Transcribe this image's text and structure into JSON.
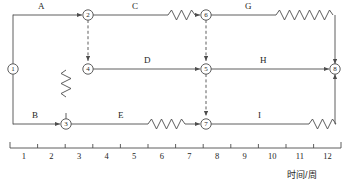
{
  "diagram": {
    "kind": "time-scaled-network-diagram",
    "stroke_color": "#4d4d4d",
    "text_color": "#262626",
    "nodes": [
      {
        "id": "n1",
        "label": "1",
        "x": 13,
        "y": 69
      },
      {
        "id": "n2",
        "label": "2",
        "x": 88,
        "y": 15
      },
      {
        "id": "n4",
        "label": "4",
        "x": 88,
        "y": 69
      },
      {
        "id": "n3",
        "label": "3",
        "x": 66,
        "y": 124
      },
      {
        "id": "n6",
        "label": "6",
        "x": 206,
        "y": 15
      },
      {
        "id": "n5",
        "label": "5",
        "x": 206,
        "y": 69
      },
      {
        "id": "n7",
        "label": "7",
        "x": 206,
        "y": 124
      },
      {
        "id": "n8",
        "label": "8",
        "x": 335,
        "y": 69
      }
    ],
    "activities": [
      {
        "id": "A",
        "label": "A",
        "label_x": 38,
        "label_y": 2,
        "from": "n1",
        "to": "n2",
        "has_float": false
      },
      {
        "id": "B",
        "label": "B",
        "label_x": 32,
        "label_y": 112,
        "from": "n1",
        "to": "n3",
        "has_float": false
      },
      {
        "id": "C",
        "label": "C",
        "label_x": 132,
        "label_y": 2,
        "from": "n2",
        "to": "n6",
        "has_float": true
      },
      {
        "id": "D",
        "label": "D",
        "label_x": 144,
        "label_y": 56,
        "from": "n4",
        "to": "n5",
        "has_float": false
      },
      {
        "id": "E",
        "label": "E",
        "label_x": 118,
        "label_y": 112,
        "from": "n3",
        "to": "n7",
        "has_float": true
      },
      {
        "id": "F",
        "label": "F",
        "label_x": 78,
        "label_y": 86,
        "from": "n3",
        "to": "n4",
        "has_float": true
      },
      {
        "id": "G",
        "label": "G",
        "label_x": 245,
        "label_y": 2,
        "from": "n6",
        "to": "n8",
        "has_float": true
      },
      {
        "id": "H",
        "label": "H",
        "label_x": 260,
        "label_y": 56,
        "from": "n5",
        "to": "n8",
        "has_float": false
      },
      {
        "id": "I",
        "label": "I",
        "label_x": 258,
        "label_y": 112,
        "from": "n7",
        "to": "n8",
        "has_float": true
      }
    ],
    "dummy_activities": [
      {
        "id": "d-2-4",
        "from": "n2",
        "to": "n4",
        "style": "dashed-arrow"
      },
      {
        "id": "d-6-5",
        "from": "n6",
        "to": "n5",
        "style": "dashed-arrow"
      },
      {
        "id": "d-5-7",
        "from": "n5",
        "to": "n7",
        "style": "dashed-arrow"
      }
    ]
  },
  "axis": {
    "label": "时间/周",
    "label_x": 287,
    "label_y": 170,
    "ticks": [
      "1",
      "2",
      "3",
      "4",
      "5",
      "6",
      "7",
      "8",
      "9",
      "10",
      "11",
      "12"
    ],
    "x_start": 10,
    "x_end": 341,
    "y": 148
  }
}
